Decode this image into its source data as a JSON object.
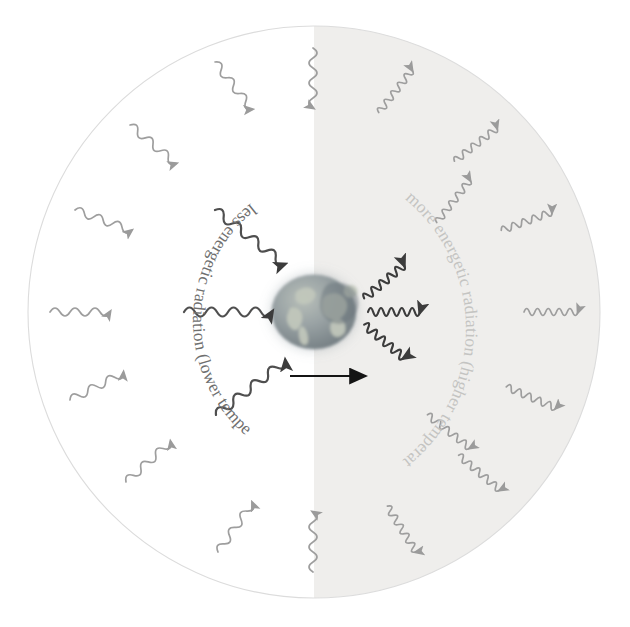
{
  "figure": {
    "background_color": "#ffffff",
    "outer_circle": {
      "name": "atmosphere-boundary-circle",
      "cx": 314,
      "cy": 312,
      "r": 286,
      "stroke": "#d8d8d8",
      "left_half_fill": "#ffffff",
      "right_half_fill": "#f0efed"
    },
    "earth": {
      "name": "earth-globe",
      "cx": 314,
      "cy": 312,
      "rx": 42,
      "ry": 37,
      "ocean_color": "#8e9aa0",
      "land_color": "#b9bfb4",
      "shadow_color": "#6f7a80"
    },
    "labels": {
      "left_arc": "less energetic radiation (lower temperature)",
      "right_arc": "more energetic radiation (higher temperature)",
      "left_arc_color": "#7a7a7a",
      "right_arc_color": "#c9c9c7"
    },
    "transition_arrow": {
      "name": "transition-arrow",
      "color": "#1a1a1a",
      "x1": 290,
      "x2": 370,
      "y": 376
    },
    "waves": {
      "inner_left": {
        "description": "long wavelength, low frequency waves travelling inward to Earth from the left",
        "count": 3,
        "color": "#4a4a4a",
        "wavelength": "long",
        "direction": "toward-earth"
      },
      "inner_right": {
        "description": "short wavelength, high frequency waves travelling inward to Earth from the right",
        "count": 3,
        "color": "#3c3c3c",
        "wavelength": "short",
        "direction": "toward-earth"
      },
      "outer_ring_left": {
        "description": "faint long waves in the outer left ring pointing inward",
        "count": 9,
        "color": "#9b9b9b",
        "wavelength": "long",
        "direction": "inward"
      },
      "outer_ring_right": {
        "description": "faint short waves in the outer right ring pointing inward",
        "count": 9,
        "color": "#9b9b9b",
        "wavelength": "short",
        "direction": "inward"
      }
    },
    "bleed_through_text": [
      "der",
      "the",
      "nt in",
      "vels of IR",
      "e called the",
      "te the sun",
      "nd the earth",
      "but this will",
      "ed the",
      "ap the energy",
      "our radiation of the",
      "warming of the atmos",
      "een temperature",
      "n into the atmo",
      "ertain the"
    ]
  }
}
